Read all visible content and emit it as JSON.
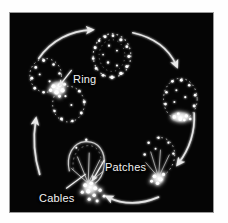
{
  "figure": {
    "panel_background": "#050505",
    "page_background": "#ffffff",
    "feature_color": "#f2f2f2",
    "arrow_color": "#e8e8e8",
    "labels": [
      {
        "id": "ring",
        "text": "Ring",
        "leader": "points down-left to bright ring structure between dividing cells"
      },
      {
        "id": "patches",
        "text": "Patches",
        "leader": "points down-left to bright punctate cluster at cell base"
      },
      {
        "id": "cables",
        "text": "Cables",
        "leader": "points up-right to filament bundle at cell base"
      }
    ],
    "cycle": {
      "direction": "clockwise",
      "arrow_count": 5,
      "stage_count": 5,
      "stages": [
        {
          "id": "stage-top",
          "position": "top-center",
          "description": "rounded cell with speckled cortical outline"
        },
        {
          "id": "stage-right",
          "position": "right",
          "description": "cell with bright polarized cap at lower pole"
        },
        {
          "id": "stage-lower-right",
          "position": "lower-right",
          "description": "cell with bright basal patch cluster and radiating cables"
        },
        {
          "id": "stage-bottom",
          "position": "bottom-center",
          "description": "elongated cell with cables and patches at base"
        },
        {
          "id": "stage-left",
          "position": "left",
          "description": "two dividing cells joined by a bright contractile ring"
        }
      ]
    }
  }
}
